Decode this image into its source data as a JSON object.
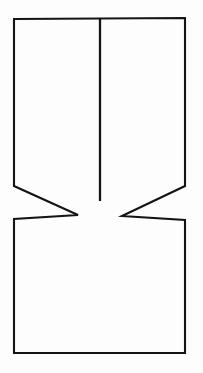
{
  "figure": {
    "kind": "line-drawing",
    "canvas": {
      "width": 203,
      "height": 373
    },
    "colors": {
      "background": "#fdfdfd",
      "ink": "#141414"
    },
    "labels": [],
    "shapes": {
      "specimen_outline": {
        "name": "notched-specimen-outline",
        "closed": true,
        "stroke_width": 2.1,
        "points": [
          [
            14,
            19
          ],
          [
            185,
            18
          ],
          [
            185,
            186
          ],
          [
            122,
            216
          ],
          [
            185,
            220
          ],
          [
            185,
            353
          ],
          [
            14,
            353
          ],
          [
            14,
            219
          ],
          [
            78,
            215
          ],
          [
            14,
            186
          ]
        ],
        "path": "M 14 19 L 185 18 L 185 186 L 122 216 L 185 220 L 185 353 L 14 353 L 14 219 L 78 215 L 14 186 Z"
      },
      "crack": {
        "name": "centre-crack-line",
        "closed": false,
        "stroke_width": 2.3,
        "points": [
          [
            100,
            19
          ],
          [
            100,
            201
          ]
        ],
        "path": "M 100 19 L 100 201"
      }
    }
  }
}
